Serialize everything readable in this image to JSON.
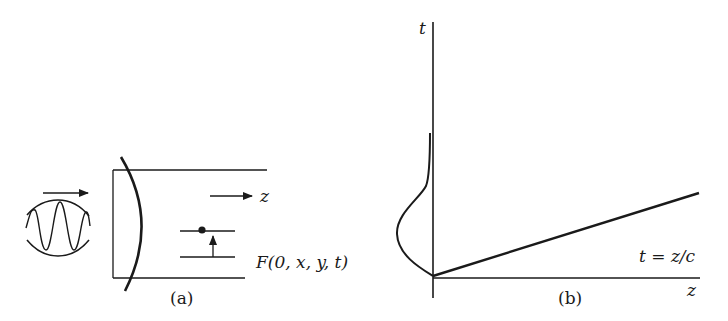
{
  "panel_a": {
    "caption": "(a)",
    "z_label": "z",
    "field_label": "F(0, x, y, t)"
  },
  "panel_b": {
    "caption": "(b)",
    "t_axis_label": "t",
    "z_axis_label": "z",
    "line_label": "t = z/c"
  },
  "colors": {
    "ink": "#1a1a1a",
    "background": "#ffffff"
  }
}
